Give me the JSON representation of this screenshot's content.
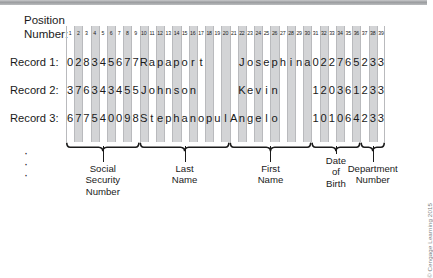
{
  "figure": {
    "position_label": "Position\nNumber:",
    "position_numbers": [
      1,
      2,
      3,
      4,
      5,
      6,
      7,
      8,
      9,
      10,
      11,
      12,
      13,
      14,
      15,
      16,
      17,
      18,
      19,
      20,
      21,
      22,
      23,
      24,
      25,
      26,
      27,
      28,
      29,
      30,
      31,
      32,
      33,
      34,
      35,
      36,
      37,
      38,
      39
    ],
    "total_columns": 39,
    "ellipsis": [
      "·",
      "·",
      "·"
    ],
    "credit": "© Cengage Learning 2015",
    "shaded_columns": [
      2,
      4,
      6,
      8,
      10,
      12,
      14,
      16,
      18,
      20,
      22,
      24,
      26,
      28,
      30,
      32,
      34,
      36,
      38
    ],
    "records": [
      {
        "label": "Record 1:",
        "characters": [
          "0",
          "2",
          "8",
          "3",
          "4",
          "5",
          "6",
          "7",
          "7",
          "R",
          "a",
          "p",
          "a",
          "p",
          "o",
          "r",
          "t",
          " ",
          " ",
          " ",
          " ",
          "J",
          "o",
          "s",
          "e",
          "p",
          "h",
          "i",
          "n",
          "a",
          "0",
          "2",
          "2",
          "7",
          "6",
          "5",
          "2",
          "3",
          "3",
          "0"
        ],
        "fields": {
          "ssn": "028345677",
          "last_name": "Rapaport",
          "first_name": "Josephina",
          "date_of_birth": "022765",
          "department_number": "2330"
        }
      },
      {
        "label": "Record 2:",
        "characters": [
          "3",
          "7",
          "6",
          "3",
          "4",
          "3",
          "4",
          "5",
          "5",
          "J",
          "o",
          "h",
          "n",
          "s",
          "o",
          "n",
          " ",
          " ",
          " ",
          " ",
          " ",
          "K",
          "e",
          "v",
          "i",
          "n",
          " ",
          " ",
          " ",
          " ",
          "1",
          "2",
          "0",
          "3",
          "6",
          "1",
          "2",
          "3",
          "3",
          "0"
        ],
        "fields": {
          "ssn": "376343455",
          "last_name": "Johnson",
          "first_name": "Kevin",
          "date_of_birth": "120361",
          "department_number": "2330"
        }
      },
      {
        "label": "Record 3:",
        "characters": [
          "6",
          "7",
          "7",
          "5",
          "4",
          "0",
          "0",
          "9",
          "8",
          "S",
          "t",
          "e",
          "p",
          "h",
          "a",
          "n",
          "o",
          "p",
          "u",
          "l",
          "A",
          "n",
          "g",
          "e",
          "l",
          "o",
          " ",
          " ",
          " ",
          " ",
          "1",
          "0",
          "1",
          "0",
          "6",
          "4",
          "2",
          "3",
          "3",
          "1"
        ],
        "fields": {
          "ssn": "677540098",
          "last_name": "Stephanopul",
          "first_name": "Angelo",
          "date_of_birth": "101064",
          "department_number": "2331"
        }
      }
    ],
    "field_groups": [
      {
        "name": "social-security-number",
        "label": "Social\nSecurity\nNumber",
        "start_col": 1,
        "end_col": 9
      },
      {
        "name": "last-name",
        "label": "Last\nName",
        "start_col": 10,
        "end_col": 20
      },
      {
        "name": "first-name",
        "label": "First\nName",
        "start_col": 21,
        "end_col": 30
      },
      {
        "name": "date-of-birth",
        "label": "Date\nof\nBirth",
        "start_col": 31,
        "end_col": 36
      },
      {
        "name": "department-number",
        "label": "Department\nNumber",
        "start_col": 37,
        "end_col": 40
      }
    ],
    "colors": {
      "shade": "#d3d4d6",
      "line": "#b9babd",
      "text": "#1a1a1a",
      "credit": "#7d7f82",
      "topbar": "#9a9c9f"
    }
  }
}
